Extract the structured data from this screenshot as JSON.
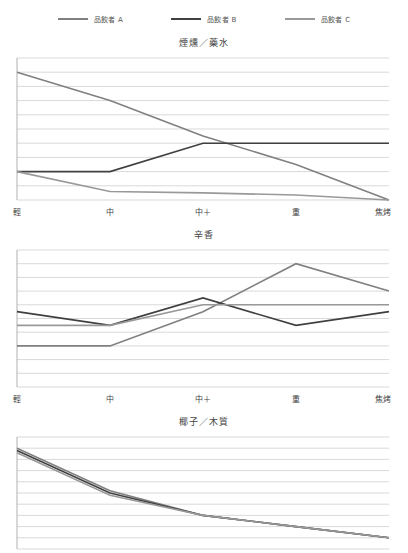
{
  "legend": {
    "items": [
      {
        "label": "品飲者 A",
        "color": "#808080",
        "key": "a"
      },
      {
        "label": "品飲者 B",
        "color": "#404040",
        "key": "b"
      },
      {
        "label": "品飲者 C",
        "color": "#999999",
        "key": "c"
      }
    ]
  },
  "axis": {
    "categories": [
      "輕",
      "中",
      "中＋",
      "重",
      "焦烤"
    ]
  },
  "chart_data": [
    {
      "type": "line",
      "title": "煙燻／藥水",
      "xlabel": "",
      "ylabel": "",
      "categories": [
        "輕",
        "中",
        "中＋",
        "重",
        "焦烤"
      ],
      "ylim": [
        0,
        10
      ],
      "yticks": [
        0,
        1,
        2,
        3,
        4,
        5,
        6,
        7,
        8,
        9,
        10
      ],
      "grid": true,
      "legend_position": "top",
      "series": [
        {
          "name": "品飲者 A",
          "color": "#808080",
          "values": [
            9,
            7,
            4.5,
            2.5,
            0
          ]
        },
        {
          "name": "品飲者 B",
          "color": "#404040",
          "values": [
            2,
            2,
            4,
            4,
            4
          ]
        },
        {
          "name": "品飲者 C",
          "color": "#999999",
          "values": [
            2,
            0.6,
            0.5,
            0.35,
            0
          ]
        }
      ]
    },
    {
      "type": "line",
      "title": "辛香",
      "xlabel": "",
      "ylabel": "",
      "categories": [
        "輕",
        "中",
        "中＋",
        "重",
        "焦烤"
      ],
      "ylim": [
        0,
        10
      ],
      "yticks": [
        0,
        1,
        2,
        3,
        4,
        5,
        6,
        7,
        8,
        9,
        10
      ],
      "grid": true,
      "legend_position": "top",
      "series": [
        {
          "name": "品飲者 A",
          "color": "#808080",
          "values": [
            3,
            3,
            5.5,
            9,
            7
          ]
        },
        {
          "name": "品飲者 B",
          "color": "#404040",
          "values": [
            5.5,
            4.5,
            6.5,
            4.5,
            5.5
          ]
        },
        {
          "name": "品飲者 C",
          "color": "#999999",
          "values": [
            4.5,
            4.5,
            6,
            6,
            6
          ]
        }
      ]
    },
    {
      "type": "line",
      "title": "椰子／木質",
      "xlabel": "",
      "ylabel": "",
      "categories": [
        "輕",
        "中",
        "中＋",
        "重",
        "焦烤"
      ],
      "ylim": [
        0,
        10
      ],
      "yticks": [
        0,
        1,
        2,
        3,
        4,
        5,
        6,
        7,
        8,
        9,
        10
      ],
      "grid": true,
      "legend_position": "top",
      "clipped": true,
      "series": [
        {
          "name": "品飲者 A",
          "color": "#808080",
          "values": [
            9,
            5.2,
            3,
            2,
            1
          ]
        },
        {
          "name": "品飲者 B",
          "color": "#404040",
          "values": [
            8.8,
            5.0,
            3,
            2,
            1
          ]
        },
        {
          "name": "品飲者 C",
          "color": "#999999",
          "values": [
            8.6,
            4.8,
            3,
            2,
            1
          ]
        }
      ]
    }
  ]
}
